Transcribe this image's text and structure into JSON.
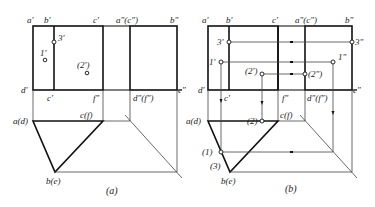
{
  "panel_a": {
    "caption": "(a)",
    "labels": {
      "a_prime": "a'",
      "b_prime": "b'",
      "c_prime": "c'",
      "a2c2": "a\"(c\")",
      "b2": "b\"",
      "p3": "3'",
      "p1": "1'",
      "p2": "(2')",
      "d_prime": "d'",
      "c_prime_low": "c'",
      "f2": "f\"",
      "d2f2": "d\"(f\")",
      "e2": "e\"",
      "ad": "a(d)",
      "cf": "c(f)",
      "be": "b(e)"
    }
  },
  "panel_b": {
    "caption": "(b)",
    "labels": {
      "a_prime": "a'",
      "b_prime": "b'",
      "c_prime": "c'",
      "a2c2": "a\"(c\")",
      "b2": "b\"",
      "p3": "3'",
      "p1": "1'",
      "p2": "(2')",
      "p3_2": "3\"",
      "p1_2": "1\"",
      "p2_2": "(2\")",
      "d_prime": "d'",
      "c_prime_low": "c'",
      "f2": "f\"",
      "d2f2": "d\"(f\")",
      "e2": "e\"",
      "ad": "a(d)",
      "cf": "c(f)",
      "be": "b(e)",
      "p2h": "(2)",
      "p1h": "(1)",
      "p3h": "(3)"
    }
  }
}
